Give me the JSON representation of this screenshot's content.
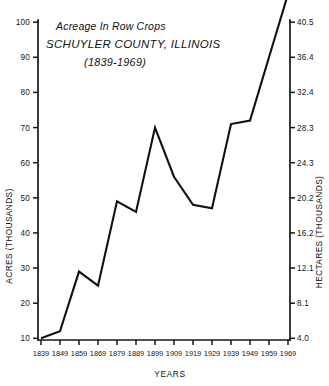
{
  "chart_data": {
    "type": "line",
    "title": "Acreage In Row Crops SCHUYLER COUNTY, ILLINOIS (1839-1969)",
    "title_lines": [
      "Acreage In Row Crops",
      "SCHUYLER COUNTY, ILLINOIS",
      "(1839-1969)"
    ],
    "xlabel": "YEARS",
    "ylabel": "ACRES (THOUSANDS)",
    "y2label": "HECTARES (THOUSANDS)",
    "grid": false,
    "legend": "none",
    "x": [
      1839,
      1849,
      1859,
      1869,
      1879,
      1889,
      1899,
      1909,
      1919,
      1929,
      1939,
      1949,
      1959,
      1969
    ],
    "xtick_labels": [
      "1839",
      "1849",
      "1859",
      "1869",
      "1879",
      "1889",
      "1899",
      "1909",
      "1919",
      "1929",
      "1939",
      "1949",
      "1959",
      "1969"
    ],
    "values": [
      10,
      12,
      29,
      25,
      49,
      46,
      70,
      56,
      48,
      47,
      71,
      72,
      90,
      108
    ],
    "ylim": [
      5,
      103
    ],
    "ytick_values": [
      10,
      20,
      30,
      40,
      50,
      60,
      70,
      80,
      90,
      100
    ],
    "ytick_labels": [
      "10",
      "20",
      "30",
      "40",
      "50",
      "60",
      "70",
      "80",
      "90",
      "100"
    ],
    "y2lim": [
      2.0,
      41.7
    ],
    "y2tick_values": [
      4.0,
      8.1,
      12.1,
      16.2,
      20.2,
      24.3,
      28.3,
      32.4,
      36.4,
      40.5
    ],
    "y2tick_labels": [
      "4.0",
      "8.1",
      "12.1",
      "16.2",
      "20.2",
      "24.3",
      "28.3",
      "32.4",
      "36.4",
      "40.5"
    ],
    "series": [
      {
        "name": "Acreage In Row Crops",
        "values": [
          10,
          12,
          29,
          25,
          49,
          46,
          70,
          56,
          48,
          47,
          71,
          72,
          90,
          108
        ]
      }
    ],
    "line_color": "#111111",
    "background_color": "#ffffff"
  }
}
